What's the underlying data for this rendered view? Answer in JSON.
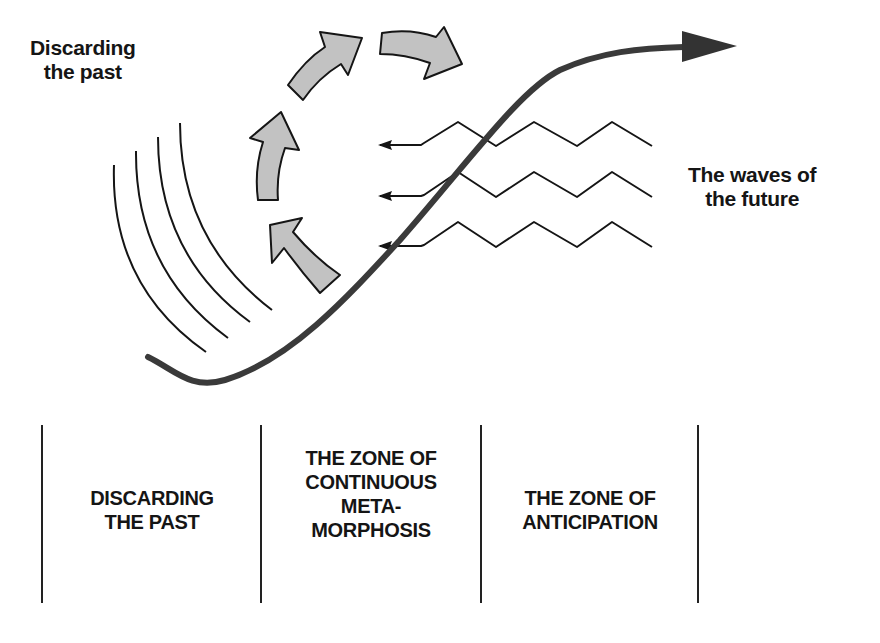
{
  "labels": {
    "discarding_past": [
      "Discarding",
      "the past"
    ],
    "waves_of_future": [
      "The waves of",
      "the future"
    ]
  },
  "zones": [
    {
      "lines": [
        "DISCARDING",
        "THE PAST"
      ]
    },
    {
      "lines": [
        "THE ZONE OF",
        "CONTINUOUS",
        "META-",
        "MORPHOSIS"
      ]
    },
    {
      "lines": [
        "THE ZONE OF",
        "ANTICIPATION"
      ]
    }
  ],
  "colors": {
    "ink": "#151515",
    "arrow_fill": "#c2c2c2",
    "main_curve": "#3a3a3a"
  }
}
